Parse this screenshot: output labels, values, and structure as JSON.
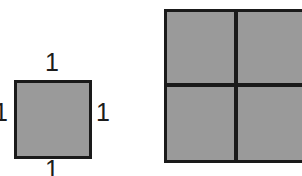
{
  "diagram": {
    "background_color": "#ffffff",
    "fill_color": "#9a9a9a",
    "stroke_color": "#1a1a1a"
  },
  "unit_square": {
    "name": "unit-square",
    "side_length": "1",
    "labels": {
      "top": "1",
      "right": "1",
      "bottom": "1",
      "left": "1"
    }
  },
  "grid_square": {
    "name": "subdivided-square",
    "rows": 2,
    "columns": 2,
    "cells": 4,
    "quadrant_names": [
      "top-left",
      "top-right",
      "bottom-left",
      "bottom-right"
    ]
  }
}
